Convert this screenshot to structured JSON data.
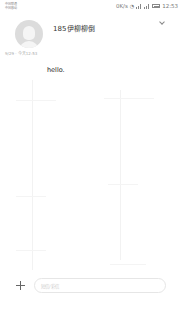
{
  "status_bar": {
    "carrier_line1": "中国联通",
    "carrier_line2": "中国移动",
    "net_speed": "0K/s",
    "network1": "4G",
    "network2": "4G",
    "time": "12:53"
  },
  "header": {
    "contact_name": "185伊柳柳倒",
    "chevron": "chevron-down-icon"
  },
  "conversation": {
    "date_line": "9/29 · 今天12:53",
    "messages": [
      {
        "text": "hello."
      }
    ]
  },
  "composer": {
    "add_icon": "plus-icon",
    "placeholder": "短信/彩信"
  },
  "colors": {
    "background": "#ffffff",
    "avatar": "#dcdcdc",
    "text": "#222222",
    "muted": "#aaaaaa"
  }
}
